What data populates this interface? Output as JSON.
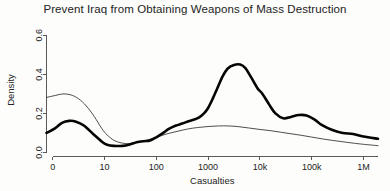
{
  "chart_data": {
    "type": "line",
    "title": "Prevent Iraq from Obtaining Weapons of Mass Destruction",
    "xlabel": "Casualties",
    "ylabel": "Density",
    "grid": false,
    "legend": "none",
    "x_tick_labels": [
      "0",
      "10",
      "100",
      "1000",
      "10k",
      "100k",
      "1M"
    ],
    "x_tick_values": [
      0,
      1,
      2,
      3,
      4,
      5,
      6
    ],
    "xlim": [
      -0.12,
      6.28
    ],
    "y_tick_labels": [
      "0.0",
      "0.2",
      "0.4",
      "0.6"
    ],
    "y_tick_values": [
      0.0,
      0.2,
      0.4,
      0.6
    ],
    "ylim": [
      0.0,
      0.64
    ],
    "series": [
      {
        "name": "thick-density-curve",
        "style": "thick",
        "x": [
          -0.12,
          0.05,
          0.18,
          0.32,
          0.45,
          0.6,
          0.78,
          0.95,
          1.05,
          1.18,
          1.35,
          1.5,
          1.62,
          1.75,
          1.88,
          2.0,
          2.12,
          2.25,
          2.38,
          2.5,
          2.62,
          2.72,
          2.82,
          2.92,
          3.0,
          3.08,
          3.18,
          3.28,
          3.38,
          3.5,
          3.62,
          3.72,
          3.82,
          3.95,
          4.05,
          4.18,
          4.3,
          4.45,
          4.6,
          4.75,
          4.9,
          5.05,
          5.2,
          5.4,
          5.6,
          5.8,
          6.0,
          6.28
        ],
        "y": [
          0.1,
          0.125,
          0.152,
          0.162,
          0.158,
          0.138,
          0.095,
          0.055,
          0.04,
          0.034,
          0.034,
          0.042,
          0.052,
          0.058,
          0.062,
          0.078,
          0.098,
          0.122,
          0.138,
          0.148,
          0.16,
          0.168,
          0.178,
          0.2,
          0.228,
          0.27,
          0.33,
          0.39,
          0.43,
          0.448,
          0.45,
          0.432,
          0.39,
          0.33,
          0.3,
          0.245,
          0.2,
          0.175,
          0.182,
          0.192,
          0.19,
          0.17,
          0.14,
          0.115,
          0.1,
          0.095,
          0.082,
          0.07
        ]
      },
      {
        "name": "thin-density-curve",
        "style": "thin",
        "x": [
          -0.12,
          0.05,
          0.2,
          0.35,
          0.5,
          0.65,
          0.8,
          0.95,
          1.05,
          1.2,
          1.4,
          1.6,
          1.8,
          2.0,
          2.2,
          2.4,
          2.6,
          2.8,
          3.0,
          3.2,
          3.4,
          3.6,
          3.8,
          4.0,
          4.2,
          4.4,
          4.6,
          4.8,
          5.0,
          5.2,
          5.4,
          5.6,
          5.8,
          6.0,
          6.28
        ],
        "y": [
          0.282,
          0.292,
          0.3,
          0.295,
          0.275,
          0.238,
          0.185,
          0.122,
          0.09,
          0.06,
          0.046,
          0.05,
          0.062,
          0.078,
          0.095,
          0.108,
          0.12,
          0.128,
          0.133,
          0.136,
          0.136,
          0.132,
          0.125,
          0.118,
          0.112,
          0.104,
          0.096,
          0.088,
          0.079,
          0.07,
          0.062,
          0.055,
          0.048,
          0.042,
          0.035
        ]
      }
    ]
  }
}
